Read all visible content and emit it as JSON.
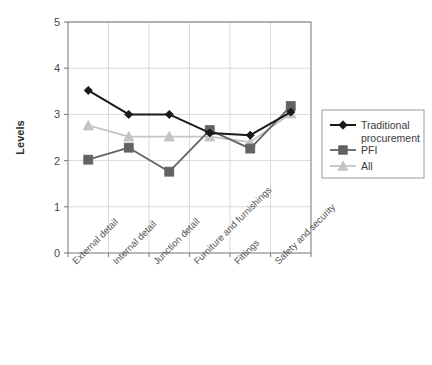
{
  "chart_data": {
    "type": "line",
    "title": "",
    "xlabel": "",
    "ylabel": "Levels",
    "ylim": [
      0,
      5
    ],
    "yticks": [
      "0",
      "1",
      "2",
      "3",
      "4",
      "5"
    ],
    "grid": true,
    "legend_position": "right",
    "categories": [
      "External detail",
      "Internal detail",
      "Junction detail",
      "Furniture and furnishings",
      "Fittings",
      "Safety and security"
    ],
    "series": [
      {
        "name": "Traditional procurement",
        "color": "#1a1a1a",
        "marker": "diamond",
        "values": [
          3.52,
          3.0,
          3.0,
          2.6,
          2.55,
          3.05
        ]
      },
      {
        "name": "PFI",
        "color": "#636363",
        "marker": "square",
        "values": [
          2.02,
          2.28,
          1.76,
          2.66,
          2.26,
          3.18
        ]
      },
      {
        "name": "All",
        "color": "#c4c4c4",
        "marker": "triangle",
        "values": [
          2.76,
          2.52,
          2.52,
          2.52,
          2.4,
          3.02
        ]
      }
    ]
  },
  "legend": {
    "entries": [
      {
        "label": "Traditional procurement"
      },
      {
        "label": "PFI"
      },
      {
        "label": "All"
      }
    ]
  },
  "colors": {
    "traditional": "#1a1a1a",
    "pfi": "#636363",
    "all": "#c4c4c4",
    "axis": "#808080",
    "grid": "#d9d9d9",
    "text": "#4a4a4a"
  }
}
